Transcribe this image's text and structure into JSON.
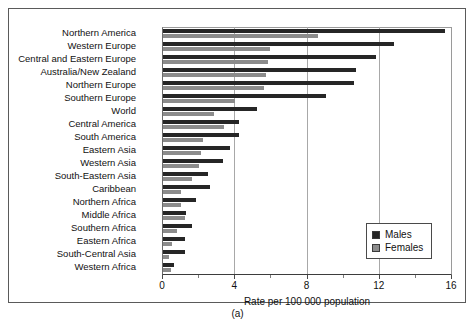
{
  "caption": "(a)",
  "legend": {
    "position": "inside-bottom-right",
    "entries": [
      {
        "label": "Males",
        "color": "#262626",
        "icon": "legend-swatch"
      },
      {
        "label": "Females",
        "color": "#8c8c8c",
        "icon": "legend-swatch"
      }
    ]
  },
  "chart_data": {
    "type": "bar",
    "orientation": "horizontal",
    "title": "",
    "xlabel": "Rate per 100 000 population",
    "ylabel": "",
    "xlim": [
      0,
      16
    ],
    "xticks": [
      0,
      4,
      8,
      12,
      16
    ],
    "xtick_labels": [
      "0",
      "4",
      "8",
      "12",
      "16"
    ],
    "minor_xticks": [
      2,
      6,
      10,
      14
    ],
    "grid": "vertical-major",
    "legend_position": "lower right inside axes",
    "categories": [
      "Northern America",
      "Western Europe",
      "Central and Eastern Europe",
      "Australia/New Zealand",
      "Northern Europe",
      "Southern Europe",
      "World",
      "Central America",
      "South America",
      "Eastern Asia",
      "Western Asia",
      "South-Eastern Asia",
      "Caribbean",
      "Northern Africa",
      "Middle Africa",
      "Southern Africa",
      "Eastern Africa",
      "South-Central Asia",
      "Western Africa"
    ],
    "series": [
      {
        "name": "Males",
        "color": "#262626",
        "values": [
          15.6,
          12.8,
          11.8,
          10.7,
          10.6,
          9.0,
          5.2,
          4.2,
          4.2,
          3.7,
          3.3,
          2.5,
          2.6,
          1.8,
          1.3,
          1.6,
          1.2,
          1.2,
          0.6
        ]
      },
      {
        "name": "Females",
        "color": "#8c8c8c",
        "values": [
          8.6,
          5.9,
          5.8,
          5.7,
          5.6,
          4.0,
          2.8,
          3.4,
          2.2,
          2.1,
          2.0,
          1.6,
          1.0,
          1.0,
          1.2,
          0.8,
          0.5,
          0.35,
          0.45
        ]
      }
    ]
  }
}
